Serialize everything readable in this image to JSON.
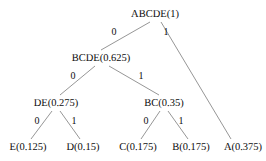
{
  "diagram": {
    "type": "huffman-code-tree",
    "background_color": "#ffffff",
    "line_color": "#8a8a8a",
    "text_color": "#0d0d0d",
    "nodes": [
      {
        "id": "root",
        "label": "ABCDE(1)",
        "symbol": "ABCDE",
        "probability": 1,
        "x": 155,
        "y": 14,
        "level": 0
      },
      {
        "id": "bcde",
        "label": "BCDE(0.625)",
        "symbol": "BCDE",
        "probability": 0.625,
        "x": 101,
        "y": 58,
        "level": 1
      },
      {
        "id": "de",
        "label": "DE(0.275)",
        "symbol": "DE",
        "probability": 0.275,
        "x": 56,
        "y": 103,
        "level": 2
      },
      {
        "id": "bc",
        "label": "BC(0.35)",
        "symbol": "BC",
        "probability": 0.35,
        "x": 164,
        "y": 103,
        "level": 2
      },
      {
        "id": "e",
        "label": "E(0.125)",
        "symbol": "E",
        "probability": 0.125,
        "x": 28,
        "y": 147,
        "level": 3
      },
      {
        "id": "d",
        "label": "D(0.15)",
        "symbol": "D",
        "probability": 0.15,
        "x": 83,
        "y": 147,
        "level": 3
      },
      {
        "id": "c",
        "label": "C(0.175)",
        "symbol": "C",
        "probability": 0.175,
        "x": 138,
        "y": 147,
        "level": 3
      },
      {
        "id": "b",
        "label": "B(0.175)",
        "symbol": "B",
        "probability": 0.175,
        "x": 191,
        "y": 147,
        "level": 3
      },
      {
        "id": "a",
        "label": "A(0.375)",
        "symbol": "A",
        "probability": 0.375,
        "x": 243,
        "y": 147,
        "level": 3
      }
    ],
    "edges": [
      {
        "id": "root-bcde",
        "from": "root",
        "to": "bcde",
        "bit": "0",
        "x1": 150,
        "y1": 22,
        "x2": 101,
        "y2": 50,
        "label_x": 114,
        "label_y": 32
      },
      {
        "id": "root-a",
        "from": "root",
        "to": "a",
        "bit": "1",
        "x1": 161,
        "y1": 22,
        "x2": 231,
        "y2": 139,
        "label_x": 166,
        "label_y": 32
      },
      {
        "id": "bcde-de",
        "from": "bcde",
        "to": "de",
        "bit": "0",
        "x1": 95,
        "y1": 66,
        "x2": 60,
        "y2": 95,
        "label_x": 73,
        "label_y": 76
      },
      {
        "id": "bcde-bc",
        "from": "bcde",
        "to": "bc",
        "bit": "1",
        "x1": 109,
        "y1": 66,
        "x2": 159,
        "y2": 95,
        "label_x": 141,
        "label_y": 76
      },
      {
        "id": "de-e",
        "from": "de",
        "to": "e",
        "bit": "0",
        "x1": 52,
        "y1": 111,
        "x2": 31,
        "y2": 139,
        "label_x": 37,
        "label_y": 121
      },
      {
        "id": "de-d",
        "from": "de",
        "to": "d",
        "bit": "1",
        "x1": 60,
        "y1": 111,
        "x2": 80,
        "y2": 139,
        "label_x": 74,
        "label_y": 121
      },
      {
        "id": "bc-c",
        "from": "bc",
        "to": "c",
        "bit": "0",
        "x1": 160,
        "y1": 111,
        "x2": 141,
        "y2": 139,
        "label_x": 146,
        "label_y": 121
      },
      {
        "id": "bc-b",
        "from": "bc",
        "to": "b",
        "bit": "1",
        "x1": 168,
        "y1": 111,
        "x2": 188,
        "y2": 139,
        "label_x": 181,
        "label_y": 121
      }
    ]
  }
}
